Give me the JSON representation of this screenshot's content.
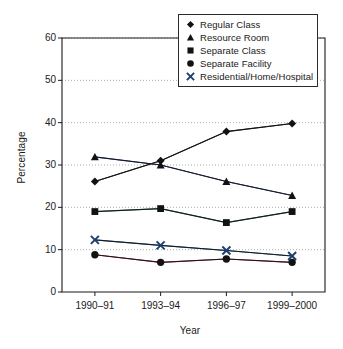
{
  "chart_data": {
    "type": "line",
    "title": "",
    "xlabel": "Year",
    "ylabel": "Percentage",
    "categories": [
      "1990–91",
      "1993–94",
      "1996–97",
      "1999–2000"
    ],
    "xtick_labels": [
      "1990–91",
      "1993–94",
      "1996–97",
      "1999–2000"
    ],
    "ytick_labels": [
      "0",
      "10",
      "20",
      "30",
      "40",
      "50",
      "60"
    ],
    "ytick_values": [
      0,
      10,
      20,
      30,
      40,
      50,
      60
    ],
    "ylim": [
      0,
      60
    ],
    "grid": "horizontal-dotted",
    "legend_position": "top-right-inside",
    "series": [
      {
        "name": "Regular Class",
        "marker": "diamond",
        "color": "#111111",
        "values": [
          26.1,
          31.0,
          37.9,
          39.8
        ]
      },
      {
        "name": "Resource Room",
        "marker": "triangle",
        "color": "#1b2f6e",
        "values": [
          31.9,
          30.0,
          26.1,
          22.8
        ]
      },
      {
        "name": "Separate Class",
        "marker": "square",
        "color": "#1c4a36",
        "values": [
          19.0,
          19.7,
          16.4,
          19.0
        ]
      },
      {
        "name": "Separate Facility",
        "marker": "circle",
        "color": "#7a1726",
        "values": [
          8.8,
          7.0,
          7.8,
          7.0
        ]
      },
      {
        "name": "Residential/Home/Hospital",
        "marker": "x",
        "color": "#1b3f6e",
        "values": [
          12.3,
          11.0,
          9.8,
          8.5
        ]
      }
    ]
  },
  "legend": {
    "items": [
      {
        "label": "Regular Class",
        "marker": "diamond-marker-icon"
      },
      {
        "label": "Resource Room",
        "marker": "triangle-marker-icon"
      },
      {
        "label": "Separate Class",
        "marker": "square-marker-icon"
      },
      {
        "label": "Separate Facility",
        "marker": "circle-marker-icon"
      },
      {
        "label": "Residential/Home/Hospital",
        "marker": "x-marker-icon"
      }
    ]
  }
}
